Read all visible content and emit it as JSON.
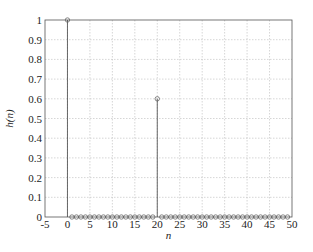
{
  "chart_data": {
    "type": "stem",
    "title": "",
    "xlabel": "n",
    "ylabel": "h(n)",
    "xlim": [
      -5,
      50
    ],
    "ylim": [
      0,
      1
    ],
    "xticks": [
      -5,
      0,
      5,
      10,
      15,
      20,
      25,
      30,
      35,
      40,
      45,
      50
    ],
    "yticks": [
      0,
      0.1,
      0.2,
      0.3,
      0.4,
      0.5,
      0.6,
      0.7,
      0.8,
      0.9,
      1
    ],
    "ytick_labels": [
      "0",
      "0.1",
      "0.2",
      "0.3",
      "0.4",
      "0.5",
      "0.6",
      "0.7",
      "0.8",
      "0.9",
      "1"
    ],
    "grid": true,
    "x": [
      0,
      1,
      2,
      3,
      4,
      5,
      6,
      7,
      8,
      9,
      10,
      11,
      12,
      13,
      14,
      15,
      16,
      17,
      18,
      19,
      20,
      21,
      22,
      23,
      24,
      25,
      26,
      27,
      28,
      29,
      30,
      31,
      32,
      33,
      34,
      35,
      36,
      37,
      38,
      39,
      40,
      41,
      42,
      43,
      44,
      45,
      46,
      47,
      48,
      49
    ],
    "values": [
      1,
      0,
      0,
      0,
      0,
      0,
      0,
      0,
      0,
      0,
      0,
      0,
      0,
      0,
      0,
      0,
      0,
      0,
      0,
      0,
      0.6,
      0,
      0,
      0,
      0,
      0,
      0,
      0,
      0,
      0,
      0,
      0,
      0,
      0,
      0,
      0,
      0,
      0,
      0,
      0,
      0,
      0,
      0,
      0,
      0,
      0,
      0,
      0,
      0,
      0
    ],
    "marker": "circle"
  }
}
